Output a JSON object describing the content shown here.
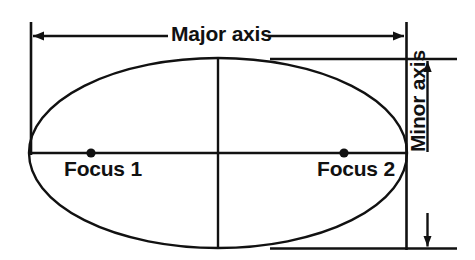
{
  "diagram": {
    "type": "geometry-diagram",
    "background_color": "#ffffff",
    "stroke_color": "#111111",
    "labels": {
      "major_axis": "Major axis",
      "minor_axis": "Minor axis",
      "focus_1": "Focus 1",
      "focus_2": "Focus 2"
    },
    "geometry": {
      "ellipse": {
        "center_x": 218,
        "center_y": 153,
        "semi_major": 189,
        "semi_minor": 95
      },
      "foci": [
        {
          "name": "Focus 1",
          "x": 91,
          "y": 153
        },
        {
          "name": "Focus 2",
          "x": 344,
          "y": 153
        }
      ],
      "major_axis_dimension": {
        "y": 36,
        "x_start": 31,
        "x_end": 406,
        "arrow_heads": "both"
      },
      "minor_axis_dimension": {
        "x": 427,
        "y_start": 59,
        "y_end": 248,
        "arrow_heads": "both"
      },
      "extension_lines": [
        {
          "name": "left-vertical",
          "x": 31,
          "y_start": 22,
          "y_end": 155
        },
        {
          "name": "right-vertical",
          "x": 406,
          "y_start": 22,
          "y_end": 250
        },
        {
          "name": "top-horizontal",
          "y": 59,
          "x_start": 270,
          "x_end": 457
        },
        {
          "name": "bottom-horizontal",
          "y": 248,
          "x_start": 270,
          "x_end": 457
        }
      ]
    }
  }
}
